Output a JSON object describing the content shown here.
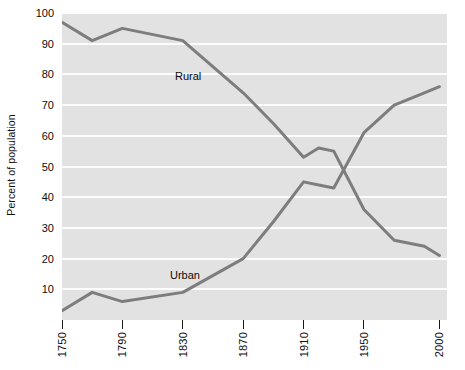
{
  "chart_data": {
    "type": "line",
    "title": "",
    "xlabel": "",
    "ylabel": "Percent of population",
    "xlim": [
      1750,
      2005
    ],
    "ylim": [
      0,
      100
    ],
    "grid": true,
    "legend_position": "inline-labels",
    "x_tick_labels": [
      "1750",
      "1790",
      "1830",
      "1870",
      "1910",
      "1950",
      "2000"
    ],
    "x_tick_values": [
      1750,
      1790,
      1830,
      1870,
      1910,
      1950,
      2000
    ],
    "y_tick_labels": [
      "10",
      "20",
      "30",
      "40",
      "50",
      "60",
      "70",
      "80",
      "90",
      "100"
    ],
    "y_tick_values": [
      10,
      20,
      30,
      40,
      50,
      60,
      70,
      80,
      90,
      100
    ],
    "series": [
      {
        "name": "Rural",
        "color": "#7d7d7d",
        "x": [
          1750,
          1770,
          1790,
          1830,
          1870,
          1890,
          1910,
          1920,
          1930,
          1950,
          1970,
          1990,
          2000
        ],
        "values": [
          97,
          91,
          95,
          91,
          74,
          64,
          53,
          56,
          55,
          36,
          26,
          24,
          21
        ]
      },
      {
        "name": "Urban",
        "color": "#7d7d7d",
        "x": [
          1750,
          1770,
          1790,
          1830,
          1870,
          1890,
          1910,
          1920,
          1930,
          1950,
          1970,
          1990,
          2000
        ],
        "values": [
          3,
          9,
          6,
          9,
          20,
          32,
          45,
          44,
          43,
          61,
          70,
          74,
          76
        ]
      }
    ],
    "annotations": [
      {
        "text": "Rural",
        "x": 1838,
        "y": 83
      },
      {
        "text": "Urban",
        "x": 1833,
        "y": 17
      }
    ]
  },
  "colors": {
    "plot_background": "#e2e2e2",
    "gridline": "#fcfcfc",
    "line": "#7d7d7d",
    "text": "#0d0d0d",
    "page_background": "#ffffff"
  },
  "source_note": ""
}
